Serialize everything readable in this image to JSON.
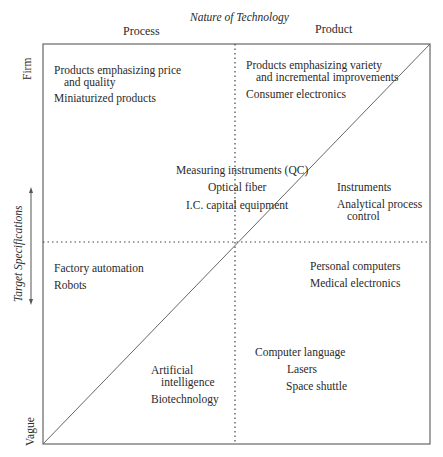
{
  "diagram": {
    "title": "Nature of Technology",
    "columns": [
      "Process",
      "Product"
    ],
    "y_axis": {
      "label": "Target Specifications",
      "top": "Firm",
      "bottom": "Vague"
    },
    "quadrants": {
      "top_left": [
        "Products emphasizing price",
        "and quality",
        "Miniaturized products"
      ],
      "top_right": [
        "Products emphasizing variety",
        "and incremental improvements",
        "Consumer electronics"
      ],
      "center": [
        "Measuring instruments (QC)",
        "Optical fiber",
        "I.C. capital equipment"
      ],
      "right_mid": [
        "Instruments",
        "Analytical process",
        "control"
      ],
      "bottom_left_mid": [
        "Factory automation",
        "Robots"
      ],
      "bottom_right_mid": [
        "Personal computers",
        "Medical electronics"
      ],
      "bottom_center_left": [
        "Artificial",
        "intelligence",
        "Biotechnology"
      ],
      "bottom_center_right": [
        "Computer language",
        "Lasers",
        "Space shuttle"
      ]
    },
    "colors": {
      "line": "#555555",
      "text": "#2a2a2a"
    }
  }
}
